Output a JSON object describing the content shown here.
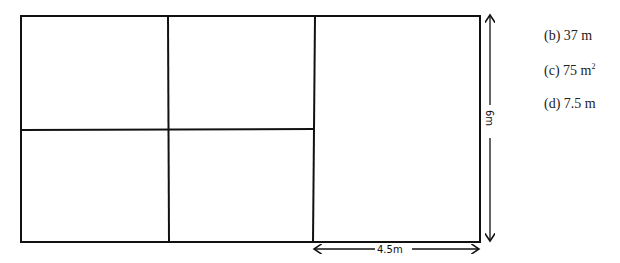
{
  "diagram": {
    "type": "grid-plan",
    "outer_rect": {
      "x": 21,
      "y": 16,
      "w": 459,
      "h": 226
    },
    "vertical_dividers_x": [
      168,
      314
    ],
    "horizontal_divider": {
      "y": 130,
      "x1": 21,
      "x2": 314
    },
    "dimension_width_label": "4.5m",
    "dimension_height_label": "6m"
  },
  "answers": [
    {
      "label": "(b) 37 m",
      "sup": ""
    },
    {
      "label": "(c) 75 m",
      "sup": "2"
    },
    {
      "label": "(d) 7.5 m",
      "sup": ""
    }
  ]
}
